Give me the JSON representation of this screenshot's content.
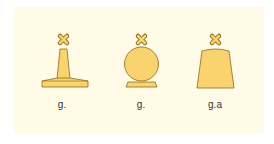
{
  "diagram": {
    "background_color": "#fffbe6",
    "fill_color": "#f8d36e",
    "stroke_color": "#8a6a1e",
    "topmark": "x-cross",
    "buoys": [
      {
        "shape": "pillar",
        "label": "g."
      },
      {
        "shape": "spherical",
        "label": "g."
      },
      {
        "shape": "can-truncated-cone",
        "label": "g.a"
      }
    ]
  }
}
